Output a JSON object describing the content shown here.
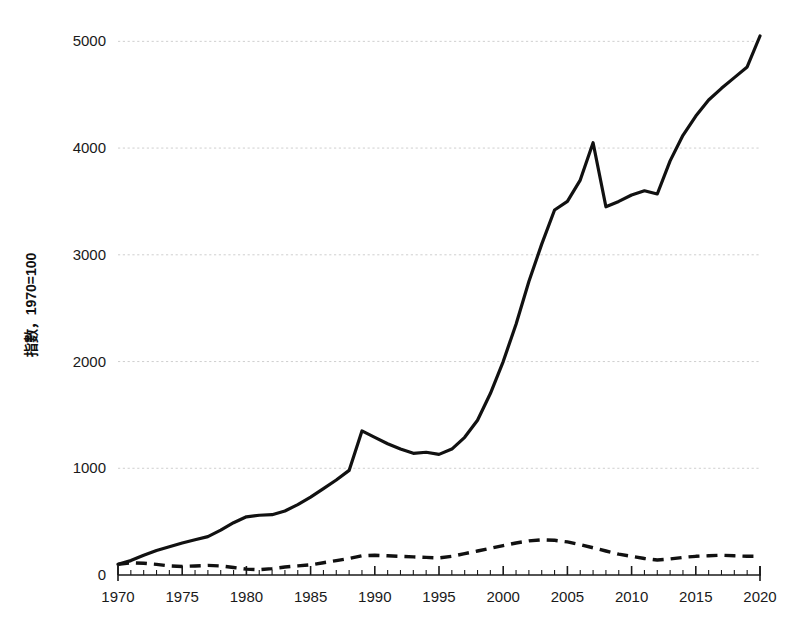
{
  "chart_data": {
    "type": "line",
    "title": "",
    "subtitle": "",
    "xlabel": "",
    "ylabel": "指數，1970=100",
    "xlim": [
      1970,
      2020
    ],
    "ylim": [
      0,
      5200
    ],
    "grid": true,
    "grid_axis": "y",
    "legend": "none",
    "y_ticks": [
      0,
      1000,
      2000,
      3000,
      4000,
      5000
    ],
    "y_tick_labels": [
      "0",
      "1000",
      "2000",
      "3000",
      "4000",
      "5000"
    ],
    "x_ticks": [
      1970,
      1975,
      1980,
      1985,
      1990,
      1995,
      2000,
      2005,
      2010,
      2015,
      2020
    ],
    "x_tick_labels": [
      "1970",
      "1975",
      "1980",
      "1985",
      "1990",
      "1995",
      "2000",
      "2005",
      "2010",
      "2015",
      "2020"
    ],
    "x_minor_tick_interval": 1,
    "x": [
      1970,
      1971,
      1972,
      1973,
      1974,
      1975,
      1976,
      1977,
      1978,
      1979,
      1980,
      1981,
      1982,
      1983,
      1984,
      1985,
      1986,
      1987,
      1988,
      1989,
      1990,
      1991,
      1992,
      1993,
      1994,
      1995,
      1996,
      1997,
      1998,
      1999,
      2000,
      2001,
      2002,
      2003,
      2004,
      2005,
      2006,
      2007,
      2008,
      2009,
      2010,
      2011,
      2012,
      2013,
      2014,
      2015,
      2016,
      2017,
      2018,
      2019,
      2020
    ],
    "series": [
      {
        "name": "solid-series",
        "style": "solid",
        "color": "#111111",
        "values": [
          100,
          135,
          185,
          230,
          265,
          300,
          330,
          360,
          420,
          490,
          545,
          560,
          565,
          600,
          660,
          730,
          810,
          890,
          980,
          1350,
          1290,
          1230,
          1180,
          1140,
          1150,
          1130,
          1180,
          1290,
          1450,
          1700,
          2000,
          2350,
          2750,
          3100,
          3420,
          3500,
          3700,
          4050,
          3450,
          3500,
          3560,
          3600,
          3570,
          3880,
          4120,
          4300,
          4450,
          4560,
          4660,
          4760,
          5050
        ]
      },
      {
        "name": "dashed-series",
        "style": "dashed",
        "color": "#111111",
        "values": [
          100,
          115,
          110,
          100,
          85,
          80,
          85,
          90,
          85,
          70,
          55,
          50,
          60,
          75,
          85,
          95,
          115,
          135,
          155,
          180,
          185,
          180,
          175,
          170,
          165,
          160,
          175,
          200,
          225,
          250,
          275,
          300,
          320,
          330,
          325,
          310,
          285,
          255,
          225,
          195,
          175,
          155,
          140,
          150,
          165,
          175,
          180,
          185,
          180,
          175,
          175
        ]
      }
    ],
    "annotations": []
  }
}
